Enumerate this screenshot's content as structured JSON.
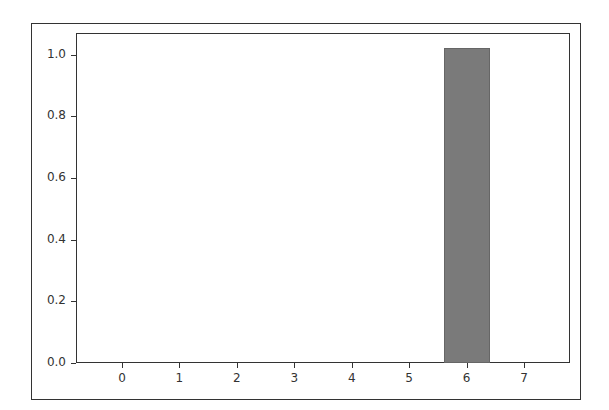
{
  "chart_data": {
    "type": "bar",
    "title": "",
    "xlabel": "",
    "ylabel": "",
    "categories": [
      "0",
      "1",
      "2",
      "3",
      "4",
      "5",
      "6",
      "7"
    ],
    "values": [
      0,
      0,
      0,
      0,
      0,
      0,
      1.02,
      0
    ],
    "xlim": [
      -0.8,
      7.8
    ],
    "ylim": [
      0,
      1.07
    ],
    "yticks": [
      "0.0",
      "0.2",
      "0.4",
      "0.6",
      "0.8",
      "1.0"
    ],
    "xticks": [
      "0",
      "1",
      "2",
      "3",
      "4",
      "5",
      "6",
      "7"
    ],
    "bar_color": "#7a7a7a",
    "grid": false,
    "legend": null
  }
}
